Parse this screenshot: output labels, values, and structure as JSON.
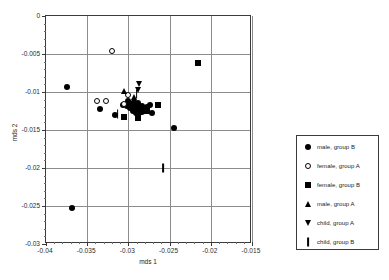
{
  "chart_data": {
    "type": "scatter",
    "title": "",
    "xlabel": "mds 1",
    "ylabel": "mds 2",
    "xlim": [
      -0.04,
      -0.015
    ],
    "ylim": [
      -0.03,
      0
    ],
    "grid": true,
    "legend_position": "right",
    "xticks": [
      "-0.04",
      "-0.035",
      "-0.03",
      "-0.025",
      "-0.02",
      "-0.015"
    ],
    "xtick_values": [
      -0.04,
      -0.035,
      -0.03,
      -0.025,
      -0.02,
      -0.015
    ],
    "yticks": [
      "0",
      "-0.005",
      "-0.01",
      "-0.015",
      "-0.02",
      "-0.025",
      "-0.03"
    ],
    "ytick_values": [
      0,
      -0.005,
      -0.01,
      -0.015,
      -0.02,
      -0.025,
      -0.03
    ],
    "series": [
      {
        "name": "male, group B",
        "marker": "filled-circle",
        "color": "#000000",
        "points": [
          [
            -0.0375,
            -0.0094
          ],
          [
            -0.0334,
            -0.0123
          ],
          [
            -0.0316,
            -0.013
          ],
          [
            -0.0307,
            -0.0117
          ],
          [
            -0.0302,
            -0.0118
          ],
          [
            -0.03,
            -0.0112
          ],
          [
            -0.0298,
            -0.0121
          ],
          [
            -0.0296,
            -0.0116
          ],
          [
            -0.0295,
            -0.0125
          ],
          [
            -0.0293,
            -0.0113
          ],
          [
            -0.0292,
            -0.012
          ],
          [
            -0.0291,
            -0.0127
          ],
          [
            -0.029,
            -0.0117
          ],
          [
            -0.0289,
            -0.0123
          ],
          [
            -0.0288,
            -0.0115
          ],
          [
            -0.0287,
            -0.0128
          ],
          [
            -0.0286,
            -0.0121
          ],
          [
            -0.0284,
            -0.0119
          ],
          [
            -0.0283,
            -0.0126
          ],
          [
            -0.0281,
            -0.0122
          ],
          [
            -0.0277,
            -0.012
          ],
          [
            -0.0274,
            -0.0117
          ],
          [
            -0.0271,
            -0.0127
          ],
          [
            -0.0245,
            -0.0148
          ],
          [
            -0.0369,
            -0.0252
          ]
        ]
      },
      {
        "name": "female, group A",
        "marker": "open-circle",
        "color": "#000000",
        "points": [
          [
            -0.032,
            -0.0046
          ],
          [
            -0.0338,
            -0.0112
          ],
          [
            -0.0327,
            -0.0112
          ],
          [
            -0.0305,
            -0.0116
          ],
          [
            -0.03,
            -0.0104
          ]
        ]
      },
      {
        "name": "female, group B",
        "marker": "filled-square",
        "color": "#000000",
        "points": [
          [
            -0.0215,
            -0.0062
          ],
          [
            -0.0264,
            -0.0117
          ],
          [
            -0.0278,
            -0.0125
          ],
          [
            -0.0305,
            -0.0133
          ],
          [
            -0.0288,
            -0.0134
          ],
          [
            -0.0281,
            -0.0121
          ]
        ]
      },
      {
        "name": "male, group A",
        "marker": "triangle-up",
        "color": "#000000",
        "points": [
          [
            -0.0305,
            -0.0099
          ],
          [
            -0.0293,
            -0.0106
          ]
        ]
      },
      {
        "name": "child, group A",
        "marker": "triangle-down",
        "color": "#000000",
        "points": [
          [
            -0.0287,
            -0.0089
          ],
          [
            -0.0288,
            -0.0097
          ]
        ]
      },
      {
        "name": "child, group B",
        "marker": "bar",
        "color": "#000000",
        "points": [
          [
            -0.029,
            -0.0102
          ],
          [
            -0.0313,
            -0.0129
          ],
          [
            -0.0258,
            -0.02
          ]
        ]
      }
    ],
    "legend": [
      {
        "label": "male, group B",
        "marker": "filled-circle"
      },
      {
        "label": "female, group A",
        "marker": "open-circle"
      },
      {
        "label": "female, group B",
        "marker": "filled-square"
      },
      {
        "label": "male, group A",
        "marker": "triangle-up"
      },
      {
        "label": "child, group A",
        "marker": "triangle-down"
      },
      {
        "label": "child, group B",
        "marker": "bar"
      }
    ]
  }
}
